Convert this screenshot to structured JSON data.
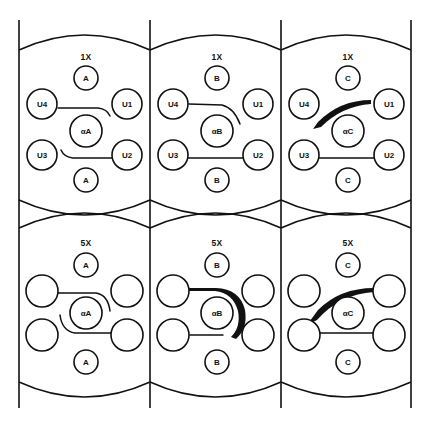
{
  "figure": {
    "background_color": "#ffffff",
    "line_color": "#111111",
    "columns": 3,
    "rows": 2
  },
  "panels": [
    {
      "id": "panel-top-left",
      "title": "1X",
      "row": "top",
      "column": 1,
      "center_node": "αA",
      "top_node": "A",
      "bottom_node": "A",
      "left_upper_node": "U4",
      "left_lower_node": "U3",
      "right_upper_node": "U1",
      "right_lower_node": "U2",
      "upper_connector": "thin-arc-down-right",
      "lower_connector": "thin-arc-up-left"
    },
    {
      "id": "panel-top-middle",
      "title": "1X",
      "row": "top",
      "column": 2,
      "center_node": "αB",
      "top_node": "B",
      "bottom_node": "B",
      "left_upper_node": "U4",
      "left_lower_node": "U3",
      "right_upper_node": "U1",
      "right_lower_node": "U2",
      "upper_connector": "thin-arc-down-right-long",
      "lower_connector": "thin-straight"
    },
    {
      "id": "panel-top-right",
      "title": "1X",
      "row": "top",
      "column": 3,
      "center_node": "αC",
      "top_node": "C",
      "bottom_node": "C",
      "left_upper_node": "U4",
      "left_lower_node": "U3",
      "right_upper_node": "U1",
      "right_lower_node": "U2",
      "upper_connector": "thick-tapered-arc-down-left",
      "lower_connector": "thin-straight"
    },
    {
      "id": "panel-bottom-left",
      "title": "5X",
      "row": "bottom",
      "column": 1,
      "center_node": "αA",
      "top_node": "A",
      "bottom_node": "A",
      "left_upper_node": "",
      "left_lower_node": "",
      "right_upper_node": "",
      "right_lower_node": "",
      "upper_connector": "thin-arc-down-right",
      "lower_connector": "thin-arc-up-left"
    },
    {
      "id": "panel-bottom-middle",
      "title": "5X",
      "row": "bottom",
      "column": 2,
      "center_node": "αB",
      "top_node": "B",
      "bottom_node": "B",
      "left_upper_node": "",
      "left_lower_node": "",
      "right_upper_node": "",
      "right_lower_node": "",
      "upper_connector": "thick-arc-wrapping-right",
      "lower_connector": "thin-arc-up-left"
    },
    {
      "id": "panel-bottom-right",
      "title": "5X",
      "row": "bottom",
      "column": 3,
      "center_node": "αC",
      "top_node": "C",
      "bottom_node": "C",
      "left_upper_node": "",
      "left_lower_node": "",
      "right_upper_node": "",
      "right_lower_node": "",
      "upper_connector": "thick-tapered-arc-down-left",
      "lower_connector": "thin-straight"
    }
  ]
}
